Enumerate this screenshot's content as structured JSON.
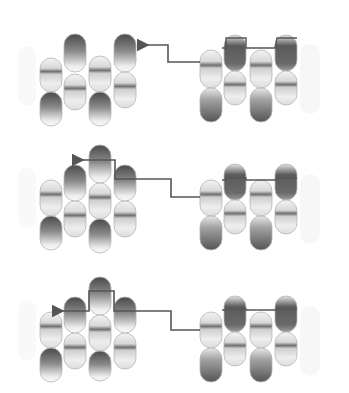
{
  "diagram": {
    "colors": {
      "background": "#ffffff",
      "dark": "#4a4a4a",
      "mid": "#9a9a9a",
      "light": "#f2f2f2",
      "line": "#555555",
      "outline": "#b5b5b5"
    },
    "capsule_width": 22,
    "panels": [
      {
        "id": "panel-1",
        "offset_y": 0,
        "left_group": [
          {
            "x": 40,
            "y": 58,
            "h": 34,
            "style": "band"
          },
          {
            "x": 40,
            "y": 92,
            "h": 34,
            "style": "dark-top"
          },
          {
            "x": 64,
            "y": 34,
            "h": 38,
            "style": "dark-top"
          },
          {
            "x": 64,
            "y": 74,
            "h": 36,
            "style": "band"
          },
          {
            "x": 89,
            "y": 56,
            "h": 36,
            "style": "band"
          },
          {
            "x": 89,
            "y": 92,
            "h": 34,
            "style": "dark-top"
          },
          {
            "x": 114,
            "y": 34,
            "h": 38,
            "style": "dark-top"
          },
          {
            "x": 114,
            "y": 72,
            "h": 36,
            "style": "band"
          }
        ],
        "right_group": [
          {
            "x": 200,
            "y": 50,
            "h": 38,
            "style": "band"
          },
          {
            "x": 200,
            "y": 88,
            "h": 34,
            "style": "dark-bottom"
          },
          {
            "x": 224,
            "y": 35,
            "h": 36,
            "style": "dark-mid"
          },
          {
            "x": 224,
            "y": 71,
            "h": 34,
            "style": "band"
          },
          {
            "x": 250,
            "y": 50,
            "h": 38,
            "style": "band"
          },
          {
            "x": 250,
            "y": 88,
            "h": 34,
            "style": "dark-bottom"
          },
          {
            "x": 275,
            "y": 35,
            "h": 36,
            "style": "dark-mid"
          },
          {
            "x": 275,
            "y": 71,
            "h": 34,
            "style": "band"
          }
        ],
        "arrow_path": "M200,62 L168,62 L168,45 L148,45",
        "arrow_head": {
          "x": 143,
          "y": 45
        },
        "right_top_line": "M222,48 L226,48 L226,38 L246,38 L246,48 L275,48 L277,38 L297,38"
      },
      {
        "id": "panel-2",
        "offset_y": 0,
        "left_group": [
          {
            "x": 40,
            "y": 180,
            "h": 36,
            "style": "band"
          },
          {
            "x": 40,
            "y": 216,
            "h": 34,
            "style": "dark-top"
          },
          {
            "x": 64,
            "y": 165,
            "h": 36,
            "style": "dark-top"
          },
          {
            "x": 64,
            "y": 201,
            "h": 36,
            "style": "band"
          },
          {
            "x": 89,
            "y": 145,
            "h": 38,
            "style": "dark-top"
          },
          {
            "x": 89,
            "y": 183,
            "h": 36,
            "style": "band"
          },
          {
            "x": 89,
            "y": 219,
            "h": 34,
            "style": "dark-top"
          },
          {
            "x": 114,
            "y": 165,
            "h": 36,
            "style": "dark-top"
          },
          {
            "x": 114,
            "y": 201,
            "h": 36,
            "style": "band"
          }
        ],
        "right_group": [
          {
            "x": 200,
            "y": 180,
            "h": 36,
            "style": "band"
          },
          {
            "x": 200,
            "y": 216,
            "h": 34,
            "style": "dark-bottom"
          },
          {
            "x": 224,
            "y": 164,
            "h": 36,
            "style": "dark-mid"
          },
          {
            "x": 224,
            "y": 200,
            "h": 34,
            "style": "band"
          },
          {
            "x": 250,
            "y": 180,
            "h": 36,
            "style": "band"
          },
          {
            "x": 250,
            "y": 216,
            "h": 34,
            "style": "dark-bottom"
          },
          {
            "x": 275,
            "y": 164,
            "h": 36,
            "style": "dark-mid"
          },
          {
            "x": 275,
            "y": 200,
            "h": 34,
            "style": "band"
          }
        ],
        "arrow_path": "M200,197 L171,197 L171,179 L115,179 L115,160 L83,160",
        "arrow_head": {
          "x": 78,
          "y": 160
        },
        "right_top_line": "M222,180 L226,180 L226,178 L246,178 L246,180 L275,180 L277,178 L297,178"
      },
      {
        "id": "panel-3",
        "offset_y": 0,
        "left_group": [
          {
            "x": 40,
            "y": 312,
            "h": 36,
            "style": "band"
          },
          {
            "x": 40,
            "y": 348,
            "h": 34,
            "style": "dark-top"
          },
          {
            "x": 64,
            "y": 297,
            "h": 36,
            "style": "dark-top"
          },
          {
            "x": 64,
            "y": 333,
            "h": 36,
            "style": "band"
          },
          {
            "x": 89,
            "y": 277,
            "h": 38,
            "style": "dark-top"
          },
          {
            "x": 89,
            "y": 315,
            "h": 36,
            "style": "band"
          },
          {
            "x": 89,
            "y": 351,
            "h": 30,
            "style": "dark-top"
          },
          {
            "x": 114,
            "y": 297,
            "h": 36,
            "style": "dark-top"
          },
          {
            "x": 114,
            "y": 333,
            "h": 36,
            "style": "band"
          }
        ],
        "right_group": [
          {
            "x": 200,
            "y": 312,
            "h": 36,
            "style": "band"
          },
          {
            "x": 200,
            "y": 348,
            "h": 34,
            "style": "dark-bottom"
          },
          {
            "x": 224,
            "y": 296,
            "h": 36,
            "style": "dark-mid"
          },
          {
            "x": 224,
            "y": 332,
            "h": 34,
            "style": "band"
          },
          {
            "x": 250,
            "y": 312,
            "h": 36,
            "style": "band"
          },
          {
            "x": 250,
            "y": 348,
            "h": 34,
            "style": "dark-bottom"
          },
          {
            "x": 275,
            "y": 296,
            "h": 36,
            "style": "dark-mid"
          },
          {
            "x": 275,
            "y": 332,
            "h": 34,
            "style": "band"
          }
        ],
        "arrow_path": "M200,330 L171,330 L171,311 L114,311 L114,291 L89,291 L89,311 L63,311",
        "arrow_head": {
          "x": 56,
          "y": 311
        },
        "right_top_line": "M222,310 L226,310 L226,309 L246,309 L246,310 L275,310 L277,309 L297,309"
      }
    ]
  }
}
